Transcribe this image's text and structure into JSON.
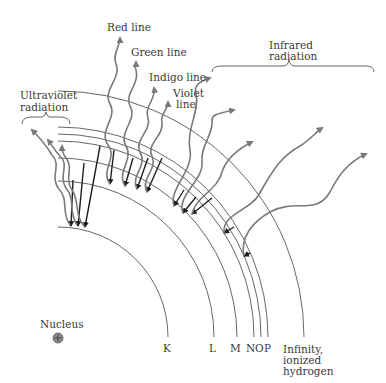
{
  "diagram": {
    "nucleus": {
      "label": "Nucleus",
      "symbol": "⊕"
    },
    "shells": [
      {
        "label": "K",
        "radius": 110
      },
      {
        "label": "L",
        "radius": 156
      },
      {
        "label": "M",
        "radius": 179
      },
      {
        "label": "N",
        "radius": 196
      },
      {
        "label": "O",
        "radius": 203
      },
      {
        "label": "P",
        "radius": 210
      }
    ],
    "infinity": {
      "line1": "Infinity,",
      "line2": "ionized",
      "line3": "hydrogen",
      "radius": 246
    },
    "groups": {
      "ultraviolet": {
        "line1": "Ultraviolet",
        "line2": "radiation"
      },
      "infrared": {
        "line1": "Infrared",
        "line2": "radiation"
      }
    },
    "visible_lines": [
      {
        "label": "Red line"
      },
      {
        "label": "Green line"
      },
      {
        "label": "Indigo line"
      },
      {
        "label": "Violet",
        "label2": "line"
      }
    ],
    "colors": {
      "shell": "#555555",
      "wave": "#7a7a7a",
      "transition": "#1e1e1e",
      "text": "#3a3a3a"
    }
  }
}
